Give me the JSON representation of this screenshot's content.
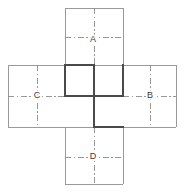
{
  "figure": {
    "canvas": {
      "width": 184,
      "height": 192
    },
    "colors": {
      "outline": "#9a9a9a",
      "bold_fold": "#4a4a4a",
      "center_line": "#8c8c8c",
      "label_text": "#3a3a3a",
      "background": "#ffffff"
    },
    "grid": {
      "x": [
        8,
        65,
        94,
        123,
        176
      ],
      "y": [
        8,
        65,
        96,
        127,
        184
      ]
    },
    "labels": [
      {
        "id": "label-a",
        "text": "A",
        "x": 93,
        "y": 40
      },
      {
        "id": "label-c",
        "text": "C",
        "x": 37,
        "y": 96
      },
      {
        "id": "label-b",
        "text": "B",
        "x": 150,
        "y": 96
      },
      {
        "id": "label-d",
        "text": "D",
        "x": 93,
        "y": 157
      }
    ],
    "faces": [
      {
        "id": "face-top",
        "label": "A",
        "x": 65,
        "y": 8,
        "w": 58,
        "h": 57
      },
      {
        "id": "face-left",
        "label": "C",
        "x": 8,
        "y": 65,
        "w": 57,
        "h": 62
      },
      {
        "id": "face-center",
        "label": "",
        "x": 65,
        "y": 65,
        "w": 58,
        "h": 62
      },
      {
        "id": "face-right",
        "label": "B",
        "x": 123,
        "y": 65,
        "w": 53,
        "h": 62
      },
      {
        "id": "face-bottom",
        "label": "D",
        "x": 65,
        "y": 127,
        "w": 58,
        "h": 57
      }
    ],
    "outline_segments": [
      {
        "id": "seg-top-left",
        "x1": 65,
        "y1": 8,
        "x2": 65,
        "y2": 65
      },
      {
        "id": "seg-top-top",
        "x1": 65,
        "y1": 8,
        "x2": 123,
        "y2": 8
      },
      {
        "id": "seg-top-right",
        "x1": 123,
        "y1": 8,
        "x2": 123,
        "y2": 65
      },
      {
        "id": "seg-left-top",
        "x1": 8,
        "y1": 65,
        "x2": 65,
        "y2": 65
      },
      {
        "id": "seg-left-left",
        "x1": 8,
        "y1": 65,
        "x2": 8,
        "y2": 127
      },
      {
        "id": "seg-left-bottom",
        "x1": 8,
        "y1": 127,
        "x2": 65,
        "y2": 127
      },
      {
        "id": "seg-right-top",
        "x1": 123,
        "y1": 65,
        "x2": 176,
        "y2": 65
      },
      {
        "id": "seg-right-right",
        "x1": 176,
        "y1": 65,
        "x2": 176,
        "y2": 127
      },
      {
        "id": "seg-right-bottom",
        "x1": 123,
        "y1": 127,
        "x2": 176,
        "y2": 127
      },
      {
        "id": "seg-bottom-left",
        "x1": 65,
        "y1": 127,
        "x2": 65,
        "y2": 184
      },
      {
        "id": "seg-bottom-bottom",
        "x1": 65,
        "y1": 184,
        "x2": 123,
        "y2": 184
      },
      {
        "id": "seg-bottom-right",
        "x1": 123,
        "y1": 127,
        "x2": 123,
        "y2": 184
      },
      {
        "id": "seg-center-top-right",
        "x1": 94,
        "y1": 65,
        "x2": 123,
        "y2": 65
      },
      {
        "id": "seg-center-bot-left",
        "x1": 65,
        "y1": 127,
        "x2": 94,
        "y2": 127
      }
    ],
    "bold_segments": [
      {
        "id": "bold-a",
        "x1": 65,
        "y1": 65,
        "x2": 94,
        "y2": 65
      },
      {
        "id": "bold-b",
        "x1": 65,
        "y1": 65,
        "x2": 65,
        "y2": 96
      },
      {
        "id": "bold-c",
        "x1": 65,
        "y1": 96,
        "x2": 123,
        "y2": 96
      },
      {
        "id": "bold-d",
        "x1": 94,
        "y1": 65,
        "x2": 94,
        "y2": 127
      },
      {
        "id": "bold-e",
        "x1": 94,
        "y1": 127,
        "x2": 123,
        "y2": 127
      },
      {
        "id": "bold-f",
        "x1": 123,
        "y1": 65,
        "x2": 123,
        "y2": 96
      }
    ],
    "center_lines": [
      {
        "id": "cl-a-v",
        "x1": 94,
        "y1": 8,
        "x2": 94,
        "y2": 65,
        "orient": "vertical"
      },
      {
        "id": "cl-a-h",
        "x1": 65,
        "y1": 37,
        "x2": 123,
        "y2": 37,
        "orient": "horizontal"
      },
      {
        "id": "cl-c-v",
        "x1": 37,
        "y1": 65,
        "x2": 37,
        "y2": 127,
        "orient": "vertical"
      },
      {
        "id": "cl-c-h",
        "x1": 8,
        "y1": 96,
        "x2": 65,
        "y2": 96,
        "orient": "horizontal"
      },
      {
        "id": "cl-m-v",
        "x1": 94,
        "y1": 65,
        "x2": 94,
        "y2": 127,
        "orient": "vertical"
      },
      {
        "id": "cl-m-h",
        "x1": 65,
        "y1": 96,
        "x2": 123,
        "y2": 96,
        "orient": "horizontal"
      },
      {
        "id": "cl-b-v",
        "x1": 150,
        "y1": 65,
        "x2": 150,
        "y2": 127,
        "orient": "vertical"
      },
      {
        "id": "cl-b-h",
        "x1": 123,
        "y1": 96,
        "x2": 176,
        "y2": 96,
        "orient": "horizontal"
      },
      {
        "id": "cl-d-v",
        "x1": 94,
        "y1": 127,
        "x2": 94,
        "y2": 184,
        "orient": "vertical"
      },
      {
        "id": "cl-d-h",
        "x1": 65,
        "y1": 157,
        "x2": 123,
        "y2": 157,
        "orient": "horizontal"
      }
    ]
  }
}
